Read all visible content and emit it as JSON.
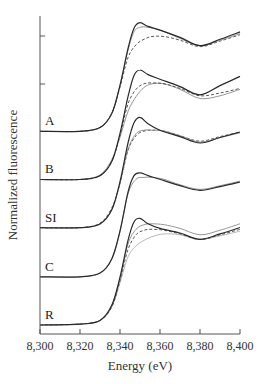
{
  "chart_data": {
    "type": "line",
    "title": "",
    "xlabel": "Energy (eV)",
    "ylabel": "Normalized fluorescence",
    "xlim": [
      8300,
      8400
    ],
    "x_ticks": [
      8300,
      8320,
      8340,
      8360,
      8380,
      8400
    ],
    "x_tick_labels": [
      "8,300",
      "8,320",
      "8,340",
      "8,360",
      "8,380",
      "8,400"
    ],
    "y_tick_labels": [],
    "grid": false,
    "legend": "none",
    "offset_between_panels": 0.52,
    "panels": [
      {
        "label": "A",
        "offset": 2.09,
        "series": [
          {
            "style": "solid-dark",
            "x": [
              8300,
              8320,
              8330,
              8336,
              8340,
              8344,
              8347,
              8350,
              8354,
              8360,
              8370,
              8380,
              8390,
              8400
            ],
            "y": [
              0.0,
              0.0,
              0.04,
              0.2,
              0.5,
              0.9,
              1.12,
              1.18,
              1.14,
              1.1,
              1.02,
              0.93,
              1.0,
              1.08
            ]
          },
          {
            "style": "solid-gray",
            "x": [
              8300,
              8320,
              8330,
              8336,
              8340,
              8344,
              8347,
              8350,
              8354,
              8360,
              8370,
              8380,
              8390,
              8400
            ],
            "y": [
              0.0,
              0.0,
              0.04,
              0.2,
              0.5,
              0.88,
              1.08,
              1.13,
              1.13,
              1.1,
              1.01,
              0.93,
              0.99,
              1.06
            ]
          },
          {
            "style": "dashed",
            "x": [
              8300,
              8320,
              8330,
              8336,
              8340,
              8344,
              8348,
              8352,
              8356,
              8362,
              8370,
              8380,
              8390,
              8400
            ],
            "y": [
              0.0,
              0.0,
              0.04,
              0.2,
              0.48,
              0.8,
              0.94,
              1.0,
              1.03,
              1.03,
              0.99,
              0.92,
              0.98,
              1.05
            ]
          }
        ]
      },
      {
        "label": "B",
        "offset": 1.57,
        "series": [
          {
            "style": "solid-dark",
            "x": [
              8300,
              8320,
              8330,
              8336,
              8340,
              8344,
              8347,
              8350,
              8354,
              8360,
              8370,
              8380,
              8390,
              8400
            ],
            "y": [
              0.0,
              0.0,
              0.04,
              0.2,
              0.5,
              0.9,
              1.13,
              1.19,
              1.14,
              1.09,
              1.01,
              0.92,
              1.02,
              1.12
            ]
          },
          {
            "style": "dashed",
            "x": [
              8300,
              8320,
              8330,
              8336,
              8340,
              8344,
              8348,
              8352,
              8356,
              8362,
              8370,
              8380,
              8390,
              8400
            ],
            "y": [
              0.0,
              0.0,
              0.04,
              0.2,
              0.48,
              0.82,
              0.98,
              1.04,
              1.05,
              1.04,
              0.99,
              0.91,
              0.94,
              0.99
            ]
          },
          {
            "style": "solid-gray",
            "x": [
              8300,
              8320,
              8330,
              8336,
              8340,
              8344,
              8348,
              8352,
              8356,
              8362,
              8370,
              8380,
              8390,
              8400
            ],
            "y": [
              0.0,
              0.0,
              0.05,
              0.22,
              0.46,
              0.74,
              0.9,
              1.0,
              1.04,
              1.04,
              0.98,
              0.88,
              0.91,
              0.98
            ]
          }
        ]
      },
      {
        "label": "SI",
        "offset": 1.05,
        "series": [
          {
            "style": "solid-dark",
            "x": [
              8300,
              8320,
              8330,
              8336,
              8340,
              8344,
              8347,
              8350,
              8354,
              8360,
              8370,
              8380,
              8390,
              8400
            ],
            "y": [
              0.0,
              0.0,
              0.04,
              0.2,
              0.5,
              0.92,
              1.14,
              1.2,
              1.13,
              1.06,
              0.99,
              0.92,
              0.98,
              1.04
            ]
          },
          {
            "style": "solid-gray",
            "x": [
              8300,
              8320,
              8330,
              8336,
              8340,
              8344,
              8348,
              8352,
              8356,
              8362,
              8370,
              8380,
              8390,
              8400
            ],
            "y": [
              0.0,
              0.0,
              0.04,
              0.2,
              0.48,
              0.85,
              1.02,
              1.06,
              1.06,
              1.05,
              1.0,
              0.93,
              0.98,
              1.03
            ]
          },
          {
            "style": "dashed",
            "x": [
              8300,
              8320,
              8330,
              8336,
              8340,
              8344,
              8348,
              8352,
              8356,
              8362,
              8370,
              8380,
              8390,
              8400
            ],
            "y": [
              0.0,
              0.0,
              0.05,
              0.22,
              0.48,
              0.84,
              1.0,
              1.05,
              1.06,
              1.05,
              1.0,
              0.94,
              0.99,
              1.04
            ]
          }
        ]
      },
      {
        "label": "C",
        "offset": 0.52,
        "series": [
          {
            "style": "solid-dark",
            "x": [
              8300,
              8320,
              8330,
              8336,
              8340,
              8344,
              8347,
              8350,
              8354,
              8360,
              8370,
              8380,
              8390,
              8400
            ],
            "y": [
              0.0,
              0.0,
              0.04,
              0.2,
              0.5,
              0.92,
              1.1,
              1.13,
              1.1,
              1.06,
              0.99,
              0.94,
              0.98,
              1.03
            ]
          },
          {
            "style": "solid-gray",
            "x": [
              8300,
              8320,
              8330,
              8336,
              8340,
              8344,
              8348,
              8352,
              8356,
              8362,
              8370,
              8380,
              8390,
              8400
            ],
            "y": [
              0.0,
              0.0,
              0.04,
              0.2,
              0.49,
              0.9,
              1.06,
              1.08,
              1.08,
              1.06,
              1.0,
              0.95,
              0.99,
              1.04
            ]
          }
        ]
      },
      {
        "label": "R",
        "offset": 0.0,
        "series": [
          {
            "style": "solid-dark",
            "x": [
              8300,
              8320,
              8330,
              8336,
              8340,
              8344,
              8347,
              8350,
              8354,
              8360,
              8370,
              8380,
              8390,
              8400
            ],
            "y": [
              0.0,
              0.01,
              0.05,
              0.22,
              0.52,
              0.92,
              1.12,
              1.16,
              1.1,
              1.05,
              1.0,
              0.93,
              0.99,
              1.06
            ]
          },
          {
            "style": "solid-gray",
            "x": [
              8300,
              8320,
              8330,
              8336,
              8340,
              8344,
              8348,
              8352,
              8356,
              8362,
              8370,
              8380,
              8390,
              8400
            ],
            "y": [
              0.0,
              0.01,
              0.05,
              0.22,
              0.5,
              0.88,
              1.04,
              1.09,
              1.1,
              1.09,
              1.05,
              0.98,
              1.03,
              1.1
            ]
          },
          {
            "style": "dashed",
            "x": [
              8300,
              8320,
              8330,
              8336,
              8340,
              8344,
              8348,
              8352,
              8356,
              8362,
              8370,
              8380,
              8390,
              8400
            ],
            "y": [
              0.0,
              0.01,
              0.05,
              0.2,
              0.48,
              0.82,
              0.98,
              1.03,
              1.04,
              1.03,
              0.99,
              0.93,
              0.98,
              1.04
            ]
          },
          {
            "style": "solid-light",
            "x": [
              8300,
              8320,
              8330,
              8336,
              8340,
              8344,
              8348,
              8352,
              8356,
              8362,
              8370,
              8380,
              8390,
              8400
            ],
            "y": [
              0.0,
              0.01,
              0.05,
              0.2,
              0.46,
              0.74,
              0.86,
              0.92,
              0.96,
              0.99,
              0.98,
              0.93,
              0.97,
              1.02
            ]
          }
        ]
      }
    ]
  },
  "axes": {
    "xlabel": "Energy (eV)",
    "ylabel": "Normalized fluorescence",
    "x_tick_labels": [
      "8,300",
      "8,320",
      "8,340",
      "8,360",
      "8,380",
      "8,400"
    ]
  },
  "colors": {
    "axis": "#555555",
    "solid-dark": "#2a2a2a",
    "solid-gray": "#8a8a8a",
    "solid-light": "#b0b0b0",
    "dashed": "#444444"
  }
}
